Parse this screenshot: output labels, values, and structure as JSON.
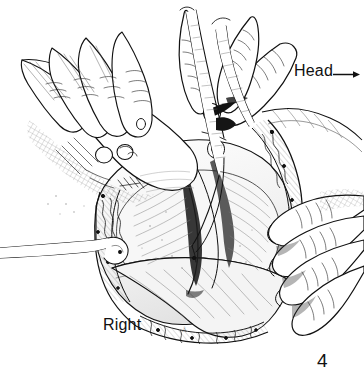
{
  "figure": {
    "number": "4",
    "artist_mark": "Å",
    "orientation_labels": {
      "head": "Head",
      "right": "Right"
    },
    "colors": {
      "ink": "#111111",
      "background": "#ffffff",
      "shading_light": "#bdbdbd",
      "shading_mid": "#8a8a8a",
      "shading_dark": "#3a3a3a"
    }
  }
}
